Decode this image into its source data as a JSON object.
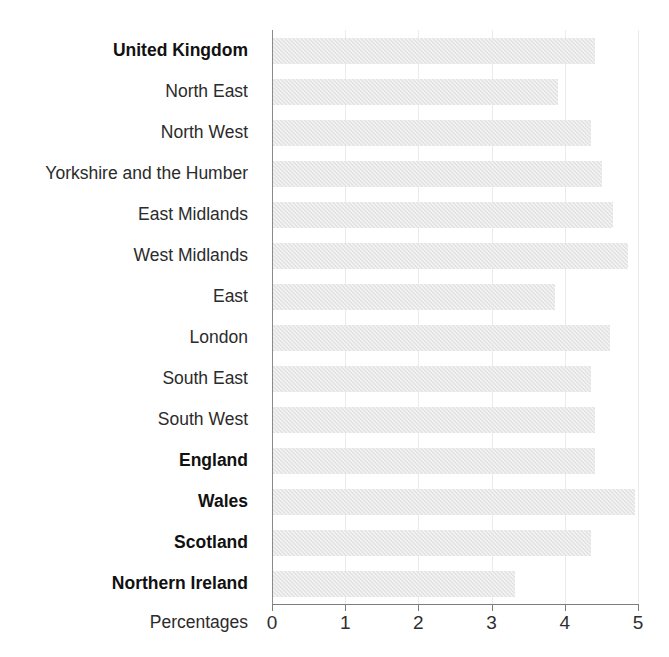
{
  "chart_data": {
    "type": "bar",
    "orientation": "horizontal",
    "title": "",
    "xlabel": "Percentages",
    "ylabel": "",
    "xlim": [
      0,
      5
    ],
    "xticks": [
      "0",
      "1",
      "2",
      "3",
      "4",
      "5"
    ],
    "grid": true,
    "legend": null,
    "bar_color": "#e3e3e3",
    "categories": [
      "United Kingdom",
      "North East",
      "North West",
      "Yorkshire and the Humber",
      "East Midlands",
      "West Midlands",
      "East",
      "London",
      "South East",
      "South West",
      "England",
      "Wales",
      "Scotland",
      "Northern Ireland"
    ],
    "values": [
      4.4,
      3.9,
      4.35,
      4.5,
      4.65,
      4.85,
      3.85,
      4.6,
      4.35,
      4.4,
      4.4,
      4.95,
      4.35,
      3.3
    ],
    "emphasis": [
      true,
      false,
      false,
      false,
      false,
      false,
      false,
      false,
      false,
      false,
      true,
      true,
      true,
      true
    ]
  },
  "axis": {
    "x_title": "Percentages",
    "ticks": [
      "0",
      "1",
      "2",
      "3",
      "4",
      "5"
    ]
  },
  "page": {
    "title_remnant": ""
  }
}
